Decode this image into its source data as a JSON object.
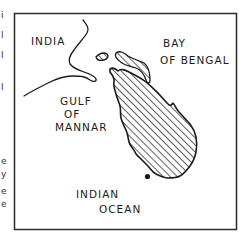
{
  "map": {
    "title": "",
    "subject": "Sri Lanka",
    "colors": {
      "ink": "#1a1a1a",
      "background": "#ffffff",
      "frame": "#2a2a2a"
    },
    "labels": {
      "india": "INDIA",
      "bay_line1": "BAY",
      "bay_line2": "OF BENGAL",
      "gulf_line1": "GULF",
      "gulf_line2": "OF",
      "gulf_line3": "MANNAR",
      "ocean_line1": "INDIAN",
      "ocean_line2": "OCEAN"
    },
    "markers": [
      {
        "name": "city-dot",
        "label": ""
      }
    ],
    "fill_pattern": "diagonal-hatch",
    "edge_fragments": [
      "i",
      "l",
      "l",
      "l",
      "e",
      "y",
      "e",
      "e"
    ]
  }
}
